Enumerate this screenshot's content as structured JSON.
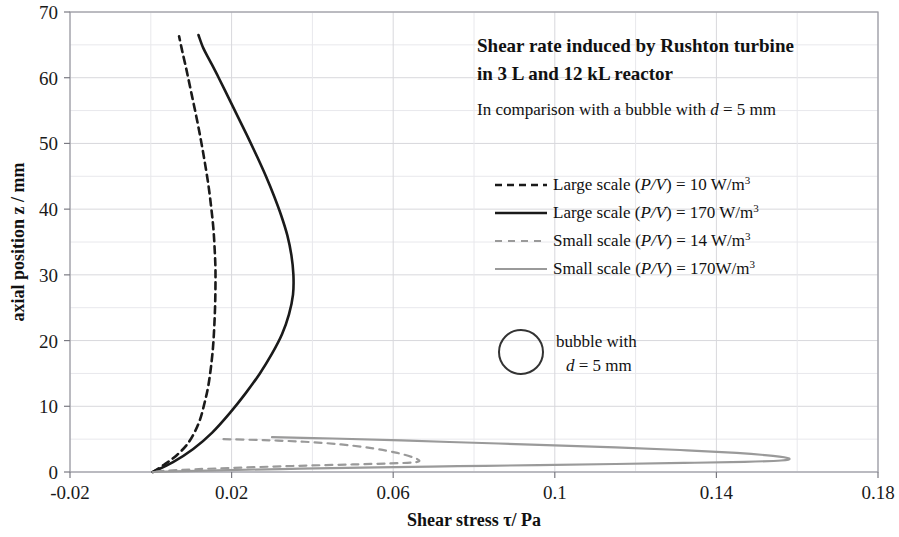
{
  "chart_data": {
    "type": "line",
    "title": "Shear rate induced by Rushton turbine in 3 L and 12 kL reactor",
    "title_line1": "Shear rate induced by Rushton turbine",
    "title_line2": "in 3 L and 12 kL reactor",
    "subtitle": "In comparison with a bubble with d = 5 mm",
    "subtitle_prefix": "In comparison with a bubble with ",
    "subtitle_var": "d",
    "subtitle_suffix": " = 5 mm",
    "xlabel": "Shear stress τ/ Pa",
    "ylabel": "axial position z / mm",
    "xlim": [
      -0.02,
      0.18
    ],
    "ylim": [
      0,
      70
    ],
    "x_ticks": [
      "-0.02",
      "0.02",
      "0.06",
      "0.1",
      "0.14",
      "0.18"
    ],
    "x_tick_values": [
      -0.02,
      0.02,
      0.06,
      0.1,
      0.14,
      0.18
    ],
    "x_minor_step": 0.02,
    "y_ticks": [
      "0",
      "10",
      "20",
      "30",
      "40",
      "50",
      "60",
      "70"
    ],
    "y_tick_values": [
      0,
      10,
      20,
      30,
      40,
      50,
      60,
      70
    ],
    "y_minor_step": 5,
    "grid": true,
    "legend_position": "inside-right",
    "series": [
      {
        "name": "Large scale (P/V) = 10 W/m³",
        "label_prefix": "Large scale (",
        "label_var1": "P/V",
        "label_suffix": ") = 10 W/m",
        "label_sup": "3",
        "style": "dashed",
        "color": "#1a1a1a",
        "width": 2.6,
        "points": [
          [
            0.0005,
            0.0
          ],
          [
            0.0035,
            1.2
          ],
          [
            0.0065,
            2.6
          ],
          [
            0.009,
            4.2
          ],
          [
            0.0108,
            6.0
          ],
          [
            0.0122,
            8.0
          ],
          [
            0.0133,
            10.5
          ],
          [
            0.0142,
            13.0
          ],
          [
            0.0149,
            16.0
          ],
          [
            0.0154,
            19.0
          ],
          [
            0.0157,
            22.0
          ],
          [
            0.0159,
            25.0
          ],
          [
            0.016,
            28.0
          ],
          [
            0.016,
            31.0
          ],
          [
            0.0158,
            34.0
          ],
          [
            0.0155,
            37.0
          ],
          [
            0.015,
            40.0
          ],
          [
            0.0143,
            43.5
          ],
          [
            0.0134,
            47.0
          ],
          [
            0.0124,
            50.5
          ],
          [
            0.0113,
            54.0
          ],
          [
            0.0101,
            57.5
          ],
          [
            0.0089,
            61.0
          ],
          [
            0.0078,
            64.0
          ],
          [
            0.007,
            66.3
          ]
        ]
      },
      {
        "name": "Large scale (P/V) = 170 W/m³",
        "label_prefix": "Large scale (",
        "label_var1": "P/V",
        "label_suffix": ") = 170 W/m",
        "label_sup": "3",
        "style": "solid",
        "color": "#1a1a1a",
        "width": 2.6,
        "points": [
          [
            0.0005,
            0.0
          ],
          [
            0.0055,
            1.5
          ],
          [
            0.0105,
            3.5
          ],
          [
            0.0152,
            6.0
          ],
          [
            0.0196,
            9.0
          ],
          [
            0.0235,
            12.0
          ],
          [
            0.027,
            15.0
          ],
          [
            0.03,
            18.0
          ],
          [
            0.0325,
            21.0
          ],
          [
            0.0342,
            24.0
          ],
          [
            0.0352,
            27.0
          ],
          [
            0.0353,
            30.0
          ],
          [
            0.0348,
            33.0
          ],
          [
            0.0338,
            36.0
          ],
          [
            0.0323,
            39.0
          ],
          [
            0.0305,
            42.0
          ],
          [
            0.0285,
            45.0
          ],
          [
            0.0263,
            48.0
          ],
          [
            0.024,
            51.0
          ],
          [
            0.0216,
            54.0
          ],
          [
            0.0192,
            57.0
          ],
          [
            0.0168,
            60.0
          ],
          [
            0.0147,
            62.5
          ],
          [
            0.013,
            64.5
          ],
          [
            0.0118,
            66.5
          ]
        ]
      },
      {
        "name": "Small scale (P/V) = 14 W/m³",
        "label_prefix": "Small scale (",
        "label_var1": "P/V",
        "label_suffix": ") = 14 W/m",
        "label_sup": "3",
        "style": "dashed",
        "color": "#9a9a9a",
        "width": 2.2,
        "points": [
          [
            0.018,
            5.0
          ],
          [
            0.028,
            4.85
          ],
          [
            0.038,
            4.6
          ],
          [
            0.047,
            4.2
          ],
          [
            0.055,
            3.6
          ],
          [
            0.061,
            2.9
          ],
          [
            0.065,
            2.2
          ],
          [
            0.0665,
            1.7
          ],
          [
            0.065,
            1.45
          ],
          [
            0.059,
            1.3
          ],
          [
            0.05,
            1.15
          ],
          [
            0.04,
            1.0
          ],
          [
            0.03,
            0.82
          ],
          [
            0.02,
            0.62
          ],
          [
            0.011,
            0.42
          ],
          [
            0.004,
            0.2
          ],
          [
            0.0005,
            0.0
          ]
        ]
      },
      {
        "name": "Small scale (P/V) = 170W/m³",
        "label_prefix": "Small scale (",
        "label_var1": "P/V",
        "label_suffix": ") = 170W/m",
        "label_sup": "3",
        "style": "solid",
        "color": "#9a9a9a",
        "width": 2.2,
        "points": [
          [
            0.03,
            5.3
          ],
          [
            0.045,
            5.1
          ],
          [
            0.062,
            4.8
          ],
          [
            0.08,
            4.45
          ],
          [
            0.098,
            4.1
          ],
          [
            0.115,
            3.75
          ],
          [
            0.131,
            3.35
          ],
          [
            0.145,
            2.9
          ],
          [
            0.154,
            2.45
          ],
          [
            0.158,
            2.05
          ],
          [
            0.156,
            1.75
          ],
          [
            0.147,
            1.55
          ],
          [
            0.132,
            1.38
          ],
          [
            0.115,
            1.22
          ],
          [
            0.096,
            1.05
          ],
          [
            0.076,
            0.88
          ],
          [
            0.056,
            0.7
          ],
          [
            0.037,
            0.5
          ],
          [
            0.019,
            0.3
          ],
          [
            0.006,
            0.1
          ],
          [
            0.0005,
            0.0
          ]
        ]
      }
    ],
    "annotations": [
      {
        "name": "bubble-marker",
        "type": "circle",
        "label_line1": "bubble with",
        "label_line2_var": "d",
        "label_line2_rest": " = 5 mm",
        "color": "#333333"
      }
    ]
  },
  "legend": {
    "entries": [
      "Large scale (P/V) = 10 W/m³",
      "Large scale (P/V) = 170 W/m³",
      "Small scale (P/V) = 14 W/m³",
      "Small scale (P/V) = 170W/m³"
    ]
  },
  "colors": {
    "dark": "#1a1a1a",
    "gray": "#9a9a9a",
    "grid": "#d8d8dc",
    "grid_minor": "#e8e8ec",
    "axis": "#909098"
  }
}
